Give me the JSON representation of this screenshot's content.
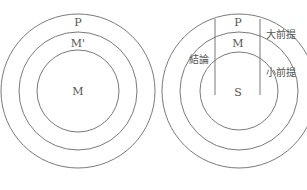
{
  "left_diagram": {
    "name": "nested-circles-M-prime",
    "circles": [
      {
        "role": "outer",
        "label": "P"
      },
      {
        "role": "middle",
        "label": "M'"
      },
      {
        "role": "inner",
        "label": "M"
      }
    ]
  },
  "right_diagram": {
    "name": "syllogism-circles",
    "circles": [
      {
        "role": "outer",
        "label": "P"
      },
      {
        "role": "middle",
        "label": "M"
      },
      {
        "role": "inner",
        "label": "S"
      }
    ],
    "annotations": {
      "conclusion": "結論",
      "major_premise": "大前提",
      "minor_premise": "小前提"
    }
  },
  "colors": {
    "stroke": "#7a7a7a",
    "text": "#555555",
    "background": "#ffffff"
  }
}
